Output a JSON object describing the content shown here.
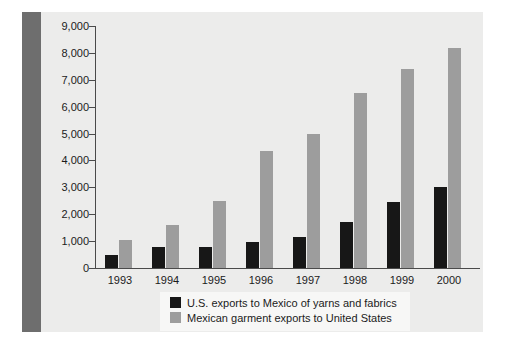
{
  "chart_data": {
    "type": "bar",
    "title": "",
    "subtitle": "",
    "xlabel": "",
    "ylabel": "",
    "categories": [
      "1993",
      "1994",
      "1995",
      "1996",
      "1997",
      "1998",
      "1999",
      "2000"
    ],
    "series": [
      {
        "name": "U.S. exports to Mexico of yarns and fabrics",
        "color": "#171717",
        "values": [
          500,
          800,
          800,
          950,
          1150,
          1700,
          2450,
          3000
        ]
      },
      {
        "name": "Mexican garment exports to United States",
        "color": "#9d9d9d",
        "values": [
          1050,
          1600,
          2500,
          4350,
          5000,
          6500,
          7400,
          8200
        ]
      }
    ],
    "ylim": [
      0,
      9000
    ],
    "ytick_values": [
      0,
      1000,
      2000,
      3000,
      4000,
      5000,
      6000,
      7000,
      8000,
      9000
    ],
    "ytick_labels": [
      "0",
      "1,000",
      "2,000",
      "3,000",
      "4,000",
      "5,000",
      "6,000",
      "7,000",
      "8,000",
      "9,000"
    ],
    "grid": false,
    "legend_position": "bottom-center"
  },
  "legend": {
    "entries": [
      {
        "label": "U.S. exports to Mexico of yarns and fabrics",
        "swatch": "black-square-swatch"
      },
      {
        "label": "Mexican garment exports to United States",
        "swatch": "gray-square-swatch"
      }
    ]
  },
  "colors": {
    "panel_background": "#ececeb",
    "spine": "#6e6e6e",
    "axis": "#4a4a4a",
    "text": "#1b1b1b",
    "legend_background": "#f7f7f6",
    "series_black": "#171717",
    "series_gray": "#9d9d9d"
  }
}
